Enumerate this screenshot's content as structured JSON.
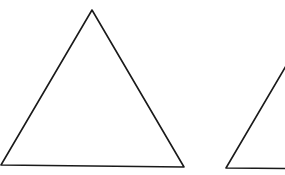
{
  "diagram": {
    "stroke_color": "#1a1a1a",
    "background": "#ffffff",
    "shapes": [
      {
        "name": "triangle-1",
        "points": "92,10 1,165 184,167"
      },
      {
        "name": "triangle-2",
        "points": "286,66 226,168 340,169"
      }
    ]
  }
}
